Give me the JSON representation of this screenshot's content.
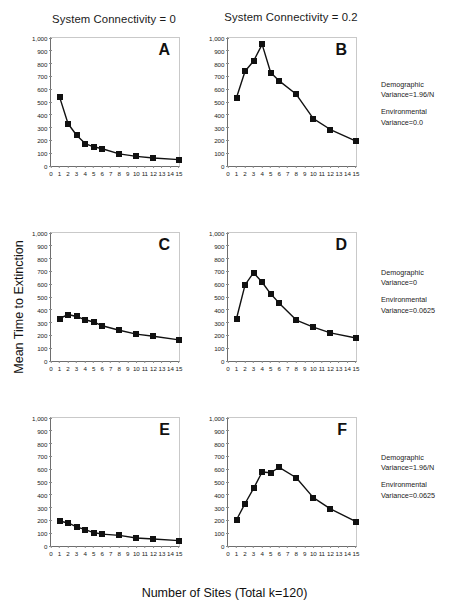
{
  "figure": {
    "x_axis_label": "Number of Sites (Total k=120)",
    "y_axis_label": "Mean Time to Extinction",
    "column_titles": [
      "System Connectivity = 0",
      "System Connectivity = 0.2"
    ]
  },
  "annotations": [
    {
      "demographic_label": "Demographic",
      "demographic_value": "Variance=1.96/N",
      "environmental_label": "Environmental",
      "environmental_value": "Variance=0.0"
    },
    {
      "demographic_label": "Demographic",
      "demographic_value": "Variance=0",
      "environmental_label": "Environmental",
      "environmental_value": "Variance=0.0625"
    },
    {
      "demographic_label": "Demographic",
      "demographic_value": "Variance=1.96/N",
      "environmental_label": "Environmental",
      "environmental_value": "Variance=0.0625"
    }
  ],
  "chart_data": [
    {
      "type": "line",
      "panel": "A",
      "title": "System Connectivity = 0",
      "xlabel": "Number of Sites (Total k=120)",
      "ylabel": "Mean Time to Extinction",
      "xlim": [
        0,
        15
      ],
      "ylim": [
        0,
        1000
      ],
      "xticks": [
        0,
        1,
        2,
        3,
        4,
        5,
        6,
        7,
        8,
        9,
        10,
        11,
        12,
        13,
        14,
        15
      ],
      "yticks": [
        0,
        100,
        200,
        300,
        400,
        500,
        600,
        700,
        800,
        900,
        1000
      ],
      "ytick_labels": [
        "0",
        "100",
        "200",
        "300",
        "400",
        "500",
        "600",
        "700",
        "800",
        "900",
        "1,000"
      ],
      "grid": false,
      "legend": "none",
      "marker": "square",
      "x": [
        1,
        2,
        3,
        4,
        5,
        6,
        8,
        10,
        12,
        15
      ],
      "values": [
        540,
        330,
        240,
        175,
        150,
        135,
        95,
        75,
        62,
        50
      ]
    },
    {
      "type": "line",
      "panel": "B",
      "title": "System Connectivity = 0.2",
      "xlabel": "Number of Sites (Total k=120)",
      "ylabel": "Mean Time to Extinction",
      "xlim": [
        0,
        15
      ],
      "ylim": [
        0,
        1000
      ],
      "xticks": [
        0,
        1,
        2,
        3,
        4,
        5,
        6,
        7,
        8,
        9,
        10,
        11,
        12,
        13,
        14,
        15
      ],
      "yticks": [
        0,
        100,
        200,
        300,
        400,
        500,
        600,
        700,
        800,
        900,
        1000
      ],
      "ytick_labels": [
        "0",
        "100",
        "200",
        "300",
        "400",
        "500",
        "600",
        "700",
        "800",
        "900",
        "1,000"
      ],
      "grid": false,
      "legend": "none",
      "marker": "square",
      "x": [
        1,
        2,
        3,
        4,
        5,
        6,
        8,
        10,
        12,
        15
      ],
      "values": [
        535,
        740,
        820,
        950,
        730,
        665,
        560,
        370,
        285,
        195
      ]
    },
    {
      "type": "line",
      "panel": "C",
      "title": "System Connectivity = 0",
      "xlabel": "Number of Sites (Total k=120)",
      "ylabel": "Mean Time to Extinction",
      "xlim": [
        0,
        15
      ],
      "ylim": [
        0,
        1000
      ],
      "xticks": [
        0,
        1,
        2,
        3,
        4,
        5,
        6,
        7,
        8,
        9,
        10,
        11,
        12,
        13,
        14,
        15
      ],
      "yticks": [
        0,
        100,
        200,
        300,
        400,
        500,
        600,
        700,
        800,
        900,
        1000
      ],
      "ytick_labels": [
        "0",
        "100",
        "200",
        "300",
        "400",
        "500",
        "600",
        "700",
        "800",
        "900",
        "1,000"
      ],
      "grid": false,
      "legend": "none",
      "marker": "square",
      "x": [
        1,
        2,
        3,
        4,
        5,
        6,
        8,
        10,
        12,
        15
      ],
      "values": [
        332,
        363,
        348,
        322,
        305,
        275,
        240,
        210,
        193,
        165
      ]
    },
    {
      "type": "line",
      "panel": "D",
      "title": "System Connectivity = 0.2",
      "xlabel": "Number of Sites (Total k=120)",
      "ylabel": "Mean Time to Extinction",
      "xlim": [
        0,
        15
      ],
      "ylim": [
        0,
        1000
      ],
      "xticks": [
        0,
        1,
        2,
        3,
        4,
        5,
        6,
        7,
        8,
        9,
        10,
        11,
        12,
        13,
        14,
        15
      ],
      "yticks": [
        0,
        100,
        200,
        300,
        400,
        500,
        600,
        700,
        800,
        900,
        1000
      ],
      "ytick_labels": [
        "0",
        "100",
        "200",
        "300",
        "400",
        "500",
        "600",
        "700",
        "800",
        "900",
        "1,000"
      ],
      "grid": false,
      "legend": "none",
      "marker": "square",
      "x": [
        1,
        2,
        3,
        4,
        5,
        6,
        8,
        10,
        12,
        15
      ],
      "values": [
        332,
        595,
        690,
        615,
        525,
        452,
        320,
        265,
        220,
        180
      ]
    },
    {
      "type": "line",
      "panel": "E",
      "title": "System Connectivity = 0",
      "xlabel": "Number of Sites (Total k=120)",
      "ylabel": "Mean Time to Extinction",
      "xlim": [
        0,
        15
      ],
      "ylim": [
        0,
        1000
      ],
      "xticks": [
        0,
        1,
        2,
        3,
        4,
        5,
        6,
        7,
        8,
        9,
        10,
        11,
        12,
        13,
        14,
        15
      ],
      "yticks": [
        0,
        100,
        200,
        300,
        400,
        500,
        600,
        700,
        800,
        900,
        1000
      ],
      "ytick_labels": [
        "0",
        "100",
        "200",
        "300",
        "400",
        "500",
        "600",
        "700",
        "800",
        "900",
        "1,000"
      ],
      "grid": false,
      "legend": "none",
      "marker": "square",
      "x": [
        1,
        2,
        3,
        4,
        5,
        6,
        8,
        10,
        12,
        15
      ],
      "values": [
        195,
        180,
        150,
        128,
        105,
        93,
        83,
        62,
        55,
        42
      ]
    },
    {
      "type": "line",
      "panel": "F",
      "title": "System Connectivity = 0.2",
      "xlabel": "Number of Sites (Total k=120)",
      "ylabel": "Mean Time to Extinction",
      "xlim": [
        0,
        15
      ],
      "ylim": [
        0,
        1000
      ],
      "xticks": [
        0,
        1,
        2,
        3,
        4,
        5,
        6,
        7,
        8,
        9,
        10,
        11,
        12,
        13,
        14,
        15
      ],
      "yticks": [
        0,
        100,
        200,
        300,
        400,
        500,
        600,
        700,
        800,
        900,
        1000
      ],
      "ytick_labels": [
        "0",
        "100",
        "200",
        "300",
        "400",
        "500",
        "600",
        "700",
        "800",
        "900",
        "1,000"
      ],
      "grid": false,
      "legend": "none",
      "marker": "square",
      "x": [
        1,
        2,
        3,
        4,
        5,
        6,
        8,
        10,
        12,
        15
      ],
      "values": [
        205,
        332,
        450,
        578,
        572,
        615,
        533,
        378,
        290,
        190
      ]
    }
  ],
  "colors": {
    "line": "#111111",
    "marker": "#111111",
    "axis": "#6e6e6e",
    "text": "#111111"
  }
}
